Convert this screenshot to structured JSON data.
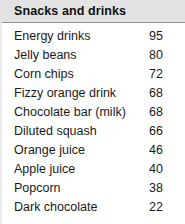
{
  "table": {
    "title": "Snacks and drinks",
    "header_background": "#e3e3e3",
    "rule_color": "#8d8d8d",
    "text_color": "#1a1a1a"
  },
  "chart_data": {
    "type": "table",
    "title": "Snacks and drinks",
    "xlabel": "",
    "ylabel": "",
    "columns": [
      "Item",
      "Value"
    ],
    "categories": [
      "Energy drinks",
      "Jelly beans",
      "Corn chips",
      "Fizzy orange drink",
      "Chocolate bar (milk)",
      "Diluted squash",
      "Orange juice",
      "Apple juice",
      "Popcorn",
      "Dark chocolate"
    ],
    "values": [
      95,
      80,
      72,
      68,
      68,
      66,
      46,
      40,
      38,
      22
    ],
    "rows": [
      {
        "label": "Energy drinks",
        "value": "95"
      },
      {
        "label": "Jelly beans",
        "value": "80"
      },
      {
        "label": "Corn chips",
        "value": "72"
      },
      {
        "label": "Fizzy orange drink",
        "value": "68"
      },
      {
        "label": "Chocolate bar (milk)",
        "value": "68"
      },
      {
        "label": "Diluted squash",
        "value": "66"
      },
      {
        "label": "Orange juice",
        "value": "46"
      },
      {
        "label": "Apple juice",
        "value": "40"
      },
      {
        "label": "Popcorn",
        "value": "38"
      },
      {
        "label": "Dark chocolate",
        "value": "22"
      }
    ]
  }
}
